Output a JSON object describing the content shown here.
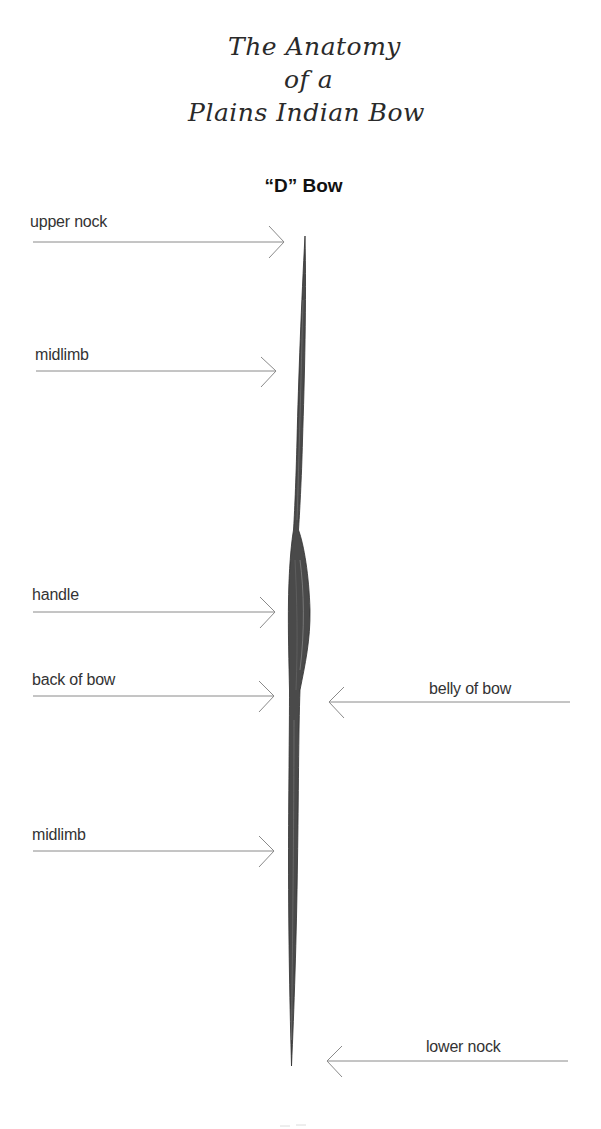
{
  "title": {
    "lines": [
      "The Anatomy",
      "of a",
      "Plains Indian Bow"
    ]
  },
  "subtitle": "“D” Bow",
  "labels": {
    "upper_nock": "upper nock",
    "midlimb_upper": "midlimb",
    "handle": "handle",
    "back_of_bow": "back of bow",
    "belly_of_bow": "belly of bow",
    "midlimb_lower": "midlimb",
    "lower_nock": "lower nock"
  },
  "colors": {
    "arrow_line": "#8a8a8a",
    "bow_fill": "#4a4a4a",
    "bow_stroke": "#333333",
    "text": "#333333"
  }
}
